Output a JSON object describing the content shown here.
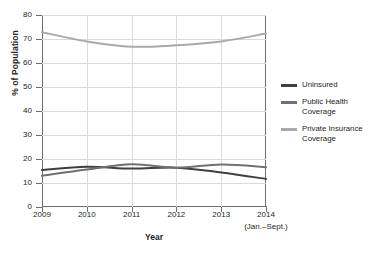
{
  "chart_data": {
    "type": "line",
    "title": "",
    "xlabel": "Year",
    "ylabel": "% of Population",
    "x": [
      "2009",
      "2010",
      "2011",
      "2012",
      "2013",
      "2014"
    ],
    "x_sublabel": "(Jan.–Sept.)",
    "xlim": [
      2009,
      2014
    ],
    "ylim": [
      0,
      80
    ],
    "yticks": [
      0,
      10,
      20,
      30,
      40,
      50,
      60,
      70,
      80
    ],
    "ytick_labels": [
      "0",
      "10",
      "20",
      "30",
      "40",
      "50",
      "60",
      "70",
      "80"
    ],
    "grid": true,
    "legend_position": "right",
    "series": [
      {
        "name": "Uninsured",
        "color": "#3f3f40",
        "values": [
          15.4,
          16.8,
          16.0,
          16.4,
          14.4,
          11.7
        ]
      },
      {
        "name": "Public Health Coverage",
        "color": "#6f7072",
        "values": [
          13.0,
          15.6,
          17.8,
          16.4,
          17.7,
          16.6
        ]
      },
      {
        "name": "Private Insurance Coverage",
        "color": "#a7a9ac",
        "values": [
          72.8,
          69.0,
          66.8,
          67.4,
          69.0,
          72.3
        ]
      }
    ]
  },
  "legend": {
    "items": [
      {
        "label": "Uninsured",
        "color": "#3f3f40"
      },
      {
        "label": "Public Health Coverage",
        "color": "#6f7072"
      },
      {
        "label": "Private Insurance Coverage",
        "color": "#a7a9ac"
      }
    ]
  },
  "axes": {
    "y_title": "% of Population",
    "x_title": "Year"
  }
}
